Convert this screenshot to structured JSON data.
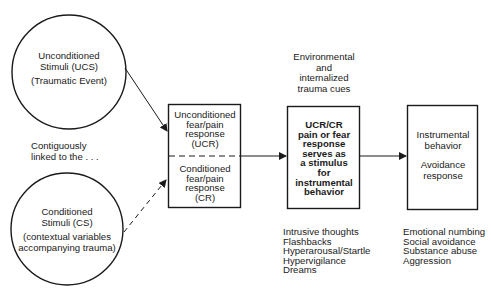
{
  "ucs": {
    "line1": "Unconditioned",
    "line2": "Stimuli (UCS)",
    "line3": "(Traumatic Event)"
  },
  "cs": {
    "line1": "Conditioned",
    "line2": "Stimuli (CS)",
    "line3": "(contextual variables",
    "line4": "accompanying trauma)"
  },
  "link_label": {
    "line1": "Contiguously",
    "line2": "linked to the . . ."
  },
  "response_box": {
    "ucr": [
      "Unconditioned",
      "fear/pain",
      "response",
      "(UCR)"
    ],
    "cr": [
      "Conditioned",
      "fear/pain",
      "response",
      "(CR)"
    ]
  },
  "cues_label": [
    "Environmental",
    "and",
    "internalized",
    "trauma cues"
  ],
  "stimulus_box": [
    "UCR/CR",
    "pain or fear",
    "response",
    "serves as",
    "a stimulus",
    "for",
    "instrumental",
    "behavior"
  ],
  "symptoms_left": [
    "Intrusive thoughts",
    "Flashbacks",
    "Hyperarousal/Startle",
    "Hypervigilance",
    "Dreams"
  ],
  "behavior_box": {
    "line1": "Instrumental",
    "line2": "behavior",
    "line3": "Avoidance",
    "line4": "response"
  },
  "symptoms_right": [
    "Emotional numbing",
    "Social avoidance",
    "Substance abuse",
    "Aggression"
  ],
  "colors": {
    "stroke": "#1a1a1a",
    "background": "#ffffff"
  }
}
